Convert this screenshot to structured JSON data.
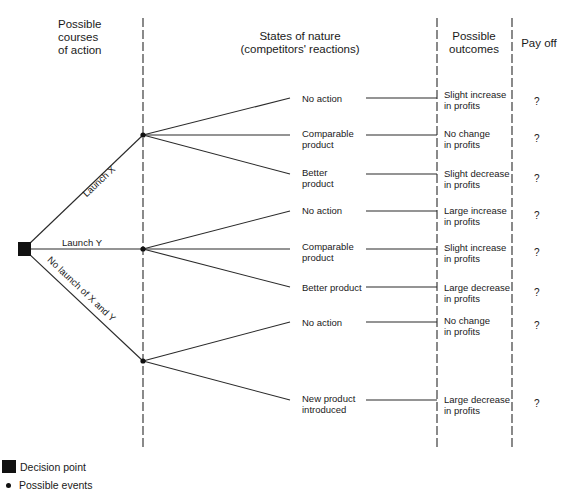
{
  "headers": {
    "courses": [
      "Possible",
      "courses",
      "of action"
    ],
    "states": [
      "States of nature",
      "(competitors' reactions)"
    ],
    "outcomes": [
      "Possible",
      "outcomes"
    ],
    "payoff": "Pay off"
  },
  "actions": [
    {
      "label": "Launch X"
    },
    {
      "label": "Launch Y"
    },
    {
      "label": "No launch of X and Y"
    }
  ],
  "states": [
    {
      "lines": [
        "No action"
      ],
      "outcome": [
        "Slight increase",
        "in profits"
      ],
      "payoff": "?"
    },
    {
      "lines": [
        "Comparable",
        "product"
      ],
      "outcome": [
        "No change",
        "in profits"
      ],
      "payoff": "?"
    },
    {
      "lines": [
        "Better",
        "product"
      ],
      "outcome": [
        "Slight decrease",
        "in profits"
      ],
      "payoff": "?"
    },
    {
      "lines": [
        "No action"
      ],
      "outcome": [
        "Large increase",
        "in profits"
      ],
      "payoff": "?"
    },
    {
      "lines": [
        "Comparable",
        "product"
      ],
      "outcome": [
        "Slight increase",
        "in profits"
      ],
      "payoff": "?"
    },
    {
      "lines": [
        "Better product"
      ],
      "outcome": [
        "Large decrease",
        "in profits"
      ],
      "payoff": "?"
    },
    {
      "lines": [
        "No action"
      ],
      "outcome": [
        "No change",
        "in profits"
      ],
      "payoff": "?"
    },
    {
      "lines": [
        "New product",
        "introduced"
      ],
      "outcome": [
        "Large decrease",
        "in profits"
      ],
      "payoff": "?"
    }
  ],
  "legend": {
    "decision_point": "Decision point",
    "possible_events": "Possible events"
  },
  "colors": {
    "line": "#2a2a2a",
    "node": "#111111",
    "background": "#ffffff"
  }
}
